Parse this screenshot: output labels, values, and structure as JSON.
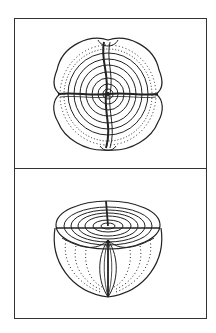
{
  "figure": {
    "panels": [
      {
        "id": "top",
        "view": "polar view (top-down)",
        "description": "Spherical body divided into four sectors by two perpendicular sutures, with concentric rings"
      },
      {
        "id": "bottom",
        "view": "oblique cut-away view",
        "description": "Same spherical body shown in perspective, cut to reveal concentric layers and meridional sutures"
      }
    ],
    "colors": {
      "ink": "#222222",
      "background": "#ffffff",
      "frame": "#333333"
    }
  }
}
